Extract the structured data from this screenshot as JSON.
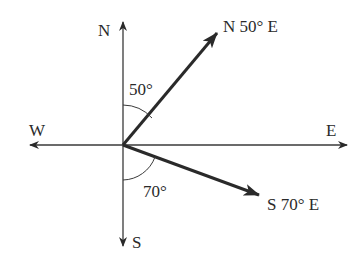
{
  "diagram": {
    "type": "compass-bearings",
    "axes": {
      "north": "N",
      "south": "S",
      "east": "E",
      "west": "W"
    },
    "bearings": [
      {
        "label": "N 50° E",
        "angle_label": "50°",
        "from": "N",
        "to": "E",
        "degrees": 50
      },
      {
        "label": "S 70° E",
        "angle_label": "70°",
        "from": "S",
        "to": "E",
        "degrees": 70
      }
    ],
    "colors": {
      "axis": "#3a3a3a",
      "vector": "#2a2a2a",
      "text": "#2a2a2a"
    }
  }
}
